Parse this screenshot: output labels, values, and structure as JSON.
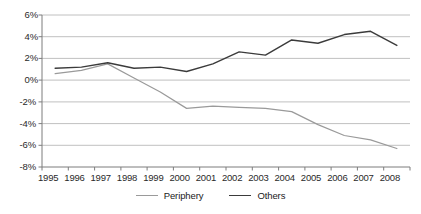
{
  "chart_data": {
    "type": "line",
    "title": "",
    "subtitle": "",
    "xlabel": "",
    "ylabel": "",
    "categories": [
      "1995",
      "1996",
      "1997",
      "1998",
      "1999",
      "2000",
      "2001",
      "2002",
      "2003",
      "2004",
      "2005",
      "2006",
      "2007",
      "2008"
    ],
    "x": [
      1995,
      1996,
      1997,
      1998,
      1999,
      2000,
      2001,
      2002,
      2003,
      2004,
      2005,
      2006,
      2007,
      2008
    ],
    "series": [
      {
        "name": "Periphery",
        "color": "#9a9a9a",
        "values": [
          0.6,
          0.9,
          1.5,
          0.2,
          -1.1,
          -2.6,
          -2.4,
          -2.5,
          -2.6,
          -2.9,
          -4.1,
          -5.1,
          -5.5,
          -6.3
        ]
      },
      {
        "name": "Others",
        "color": "#3b3b3b",
        "values": [
          1.1,
          1.2,
          1.6,
          1.1,
          1.2,
          0.8,
          1.5,
          2.6,
          2.3,
          3.7,
          3.4,
          4.2,
          4.5,
          3.2
        ]
      }
    ],
    "ylim": [
      -8,
      6
    ],
    "yticks": [
      6,
      4,
      2,
      0,
      -2,
      -4,
      -6,
      -8
    ],
    "ytick_labels": [
      "6%",
      "4%",
      "2%",
      "0%",
      "-2%",
      "-4%",
      "-6%",
      "-8%"
    ],
    "grid": true,
    "grid_axis": "y",
    "grid_color": "#b0b0b0",
    "legend_position": "bottom",
    "axis_color": "#808080",
    "value_unit": "percent"
  },
  "legend": {
    "entries": [
      {
        "label": "Periphery"
      },
      {
        "label": "Others"
      }
    ]
  }
}
